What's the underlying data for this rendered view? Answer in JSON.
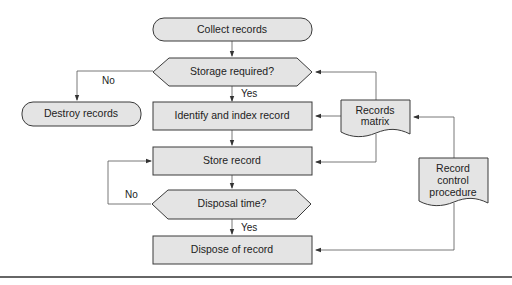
{
  "nodes": {
    "collect": {
      "label": "Collect records",
      "shape": "terminator"
    },
    "storage_required": {
      "label": "Storage required?",
      "shape": "decision"
    },
    "destroy": {
      "label": "Destroy records",
      "shape": "terminator"
    },
    "identify": {
      "label": "Identify and index record",
      "shape": "process"
    },
    "store": {
      "label": "Store record",
      "shape": "process"
    },
    "disposal_time": {
      "label": "Disposal time?",
      "shape": "decision"
    },
    "dispose": {
      "label": "Dispose of record",
      "shape": "process"
    },
    "records_matrix": {
      "label_line1": "Records",
      "label_line2": "matrix",
      "shape": "document"
    },
    "record_control": {
      "label_line1": "Record",
      "label_line2": "control",
      "label_line3": "procedure",
      "shape": "document"
    }
  },
  "edges": {
    "storage_no": "No",
    "storage_yes": "Yes",
    "disposal_no": "No",
    "disposal_yes": "Yes"
  },
  "colors": {
    "shape_fill": "#e4e4e4",
    "stroke": "#3a3a3a"
  }
}
